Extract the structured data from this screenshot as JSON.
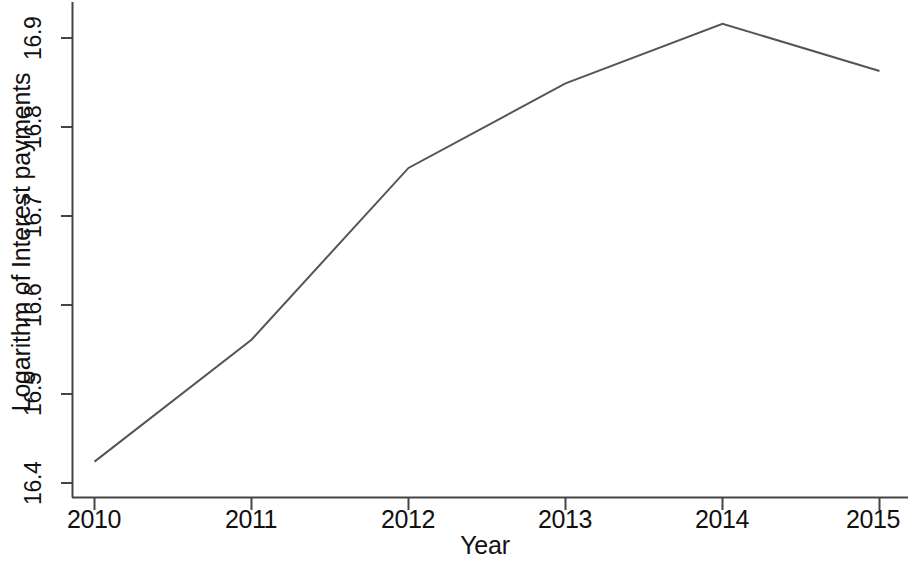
{
  "chart_data": {
    "type": "line",
    "title": "",
    "xlabel": "Year",
    "ylabel": "Logarithm of Interest payments",
    "x": [
      2010,
      2011,
      2012,
      2013,
      2014,
      2015
    ],
    "categories": [
      "2010",
      "2011",
      "2012",
      "2013",
      "2014",
      "2015"
    ],
    "values": [
      16.424,
      16.561,
      16.754,
      16.849,
      16.916,
      16.863
    ],
    "series": [
      {
        "name": "Logarithm of Interest payments",
        "values": [
          16.424,
          16.561,
          16.754,
          16.849,
          16.916,
          16.863
        ]
      }
    ],
    "xlim": [
      2010,
      2015
    ],
    "ylim": [
      16.4,
      16.93
    ],
    "y_ticks": [
      "16.4",
      "16.5",
      "16.6",
      "16.7",
      "16.8",
      "16.9"
    ],
    "y_tick_values": [
      16.4,
      16.5,
      16.6,
      16.7,
      16.8,
      16.9
    ],
    "x_ticks": [
      "2010",
      "2011",
      "2012",
      "2013",
      "2014",
      "2015"
    ],
    "grid": false,
    "legend": false,
    "legend_position": "none",
    "line_color": "#555555",
    "axis_color": "#444444",
    "background_color": "#ffffff",
    "markers": false,
    "annotations": []
  },
  "axes": {
    "y_title": "Logarithm of Interest payments",
    "x_title": "Year",
    "y_tick_labels": [
      "16.4",
      "16.5",
      "16.6",
      "16.7",
      "16.8",
      "16.9"
    ],
    "x_tick_labels": [
      "2010",
      "2011",
      "2012",
      "2013",
      "2014",
      "2015"
    ]
  }
}
